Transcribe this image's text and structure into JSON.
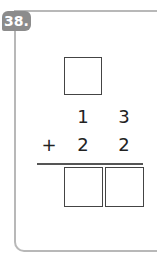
{
  "problem": {
    "number": "38.",
    "top_box": "",
    "row1": {
      "tens": "1",
      "ones": "3"
    },
    "row2": {
      "operator": "+",
      "tens": "2",
      "ones": "2"
    },
    "answer": {
      "tens": "",
      "ones": ""
    }
  },
  "colors": {
    "badge": "#8c8c8c",
    "border": "#b8b8b8",
    "ink": "#222222"
  }
}
